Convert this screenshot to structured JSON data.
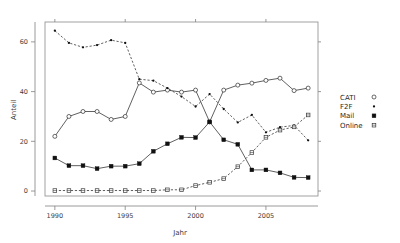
{
  "chart_data": {
    "type": "line",
    "title": "",
    "xlabel": "Jahr",
    "ylabel": "Anteil",
    "x": [
      1990,
      1991,
      1992,
      1993,
      1994,
      1995,
      1996,
      1997,
      1998,
      1999,
      2000,
      2001,
      2002,
      2003,
      2004,
      2005,
      2006,
      2007,
      2008
    ],
    "xlim": [
      1989.3,
      2008.7
    ],
    "ylim": [
      -2,
      68
    ],
    "xticks": [
      1990,
      1995,
      2000,
      2005
    ],
    "xticklabels": [
      "1990",
      "1995",
      "2000",
      "2005"
    ],
    "yticks": [
      0,
      20,
      40,
      60
    ],
    "yticklabels": [
      "0",
      "20",
      "40",
      "60"
    ],
    "grid": false,
    "legend_position": "right-outside",
    "series": [
      {
        "name": "CATI",
        "marker": "open-circle",
        "linestyle": "solid",
        "values": [
          22.0,
          30.0,
          32.0,
          32.0,
          28.8,
          30.0,
          43.5,
          39.8,
          40.6,
          39.8,
          40.6,
          27.8,
          40.6,
          42.6,
          43.4,
          44.5,
          45.4,
          40.4,
          41.4
        ]
      },
      {
        "name": "F2F",
        "marker": "dot",
        "linestyle": "dashed",
        "values": [
          64.5,
          59.6,
          57.8,
          58.7,
          60.7,
          59.6,
          45.0,
          44.4,
          41.4,
          38.0,
          34.0,
          39.0,
          33.0,
          27.6,
          30.6,
          23.6,
          25.7,
          26.4,
          20.4
        ]
      },
      {
        "name": "Mail",
        "marker": "filled-square",
        "linestyle": "solid",
        "values": [
          13.3,
          10.2,
          10.2,
          9.0,
          10.0,
          10.0,
          11.0,
          16.0,
          19.0,
          21.6,
          21.5,
          27.8,
          20.6,
          18.8,
          8.5,
          8.5,
          7.3,
          5.5,
          5.4
        ]
      },
      {
        "name": "Online",
        "marker": "open-square",
        "linestyle": "dashed",
        "values": [
          0.2,
          0.2,
          0.2,
          0.2,
          0.2,
          0.2,
          0.2,
          0.2,
          0.5,
          0.5,
          2.2,
          3.5,
          5.0,
          9.8,
          15.5,
          21.6,
          24.5,
          25.8,
          30.6
        ]
      }
    ]
  },
  "legend": {
    "items": [
      {
        "label": "CATI",
        "marker": "open-circle"
      },
      {
        "label": "F2F",
        "marker": "dot"
      },
      {
        "label": "Mail",
        "marker": "filled-square"
      },
      {
        "label": "Online",
        "marker": "open-square"
      }
    ]
  }
}
